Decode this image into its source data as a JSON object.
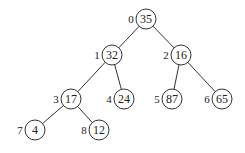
{
  "tree": {
    "type": "binary-heap-tree",
    "nodes": [
      {
        "index": "0",
        "value": "35",
        "x": 146,
        "y": 19
      },
      {
        "index": "1",
        "value": "32",
        "x": 112,
        "y": 55
      },
      {
        "index": "2",
        "value": "16",
        "x": 181,
        "y": 55
      },
      {
        "index": "3",
        "value": "17",
        "x": 71,
        "y": 99
      },
      {
        "index": "4",
        "value": "24",
        "x": 124,
        "y": 99
      },
      {
        "index": "5",
        "value": "87",
        "x": 172,
        "y": 99
      },
      {
        "index": "6",
        "value": "65",
        "x": 222,
        "y": 99
      },
      {
        "index": "7",
        "value": "4",
        "x": 35,
        "y": 130
      },
      {
        "index": "8",
        "value": "12",
        "x": 99,
        "y": 130
      }
    ],
    "edges": [
      [
        0,
        1
      ],
      [
        0,
        2
      ],
      [
        1,
        3
      ],
      [
        1,
        4
      ],
      [
        2,
        5
      ],
      [
        2,
        6
      ],
      [
        3,
        7
      ],
      [
        3,
        8
      ]
    ]
  }
}
